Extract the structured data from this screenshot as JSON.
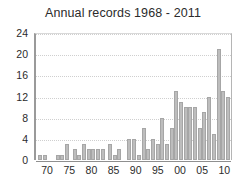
{
  "chart_data": {
    "type": "bar",
    "title": "Annual records 1968 - 2011",
    "xlabel": "",
    "ylabel": "",
    "ylim": [
      0,
      24
    ],
    "xlim": [
      1967.5,
      2011.5
    ],
    "yticks": [
      0,
      4,
      8,
      12,
      16,
      20,
      24
    ],
    "ytick_labels": [
      "0",
      "4",
      "8",
      "12",
      "16",
      "20",
      "24"
    ],
    "xtick_years": [
      1970,
      1975,
      1980,
      1985,
      1990,
      1995,
      2000,
      2005,
      2010
    ],
    "xtick_labels": [
      "70",
      "75",
      "80",
      "85",
      "90",
      "95",
      "00",
      "05",
      "10"
    ],
    "grid": true,
    "legend": null,
    "bar_color": "#bdbdbd",
    "bar_edge_color": "#a6a6a6",
    "categories": [
      "1968",
      "1969",
      "1970",
      "1971",
      "1972",
      "1973",
      "1974",
      "1975",
      "1976",
      "1977",
      "1978",
      "1979",
      "1980",
      "1981",
      "1982",
      "1983",
      "1984",
      "1985",
      "1986",
      "1987",
      "1988",
      "1989",
      "1990",
      "1991",
      "1992",
      "1993",
      "1994",
      "1995",
      "1996",
      "1997",
      "1998",
      "1999",
      "2000",
      "2001",
      "2002",
      "2003",
      "2004",
      "2005",
      "2006",
      "2007",
      "2008",
      "2009",
      "2010",
      "2011"
    ],
    "values": [
      1,
      1,
      0,
      0,
      0,
      1,
      1,
      3,
      0,
      2,
      1,
      3,
      2,
      2,
      2,
      2,
      0,
      3,
      1,
      2,
      0,
      0,
      4,
      4,
      1,
      6,
      2,
      4,
      3,
      8,
      3,
      6,
      13,
      11,
      10,
      10,
      10,
      6,
      9,
      12,
      5,
      21,
      13,
      12
    ]
  }
}
